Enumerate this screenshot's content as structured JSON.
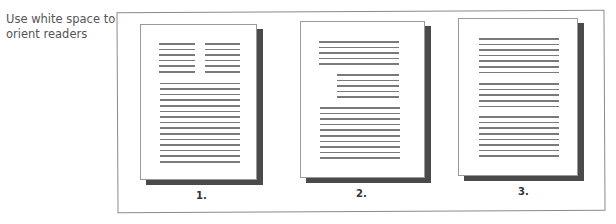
{
  "caption": "Use white space to orient readers",
  "pages": [
    {
      "label": "1.",
      "layout": "two short columns of 6 lines each, then 15 full-width lines",
      "blocks": [
        {
          "type": "column-left",
          "lines": 6
        },
        {
          "type": "column-right",
          "lines": 6
        },
        {
          "type": "full",
          "lines": 15
        }
      ]
    },
    {
      "label": "2.",
      "layout": "5 full-width lines, 5 indented lines, 10 full-width lines",
      "blocks": [
        {
          "type": "full",
          "lines": 5
        },
        {
          "type": "indented",
          "lines": 5
        },
        {
          "type": "full",
          "lines": 10
        }
      ]
    },
    {
      "label": "3.",
      "layout": "three paragraphs of 7, 5 and 8 full-width lines",
      "blocks": [
        {
          "type": "full",
          "lines": 7
        },
        {
          "type": "full",
          "lines": 5
        },
        {
          "type": "full",
          "lines": 8
        }
      ]
    }
  ]
}
